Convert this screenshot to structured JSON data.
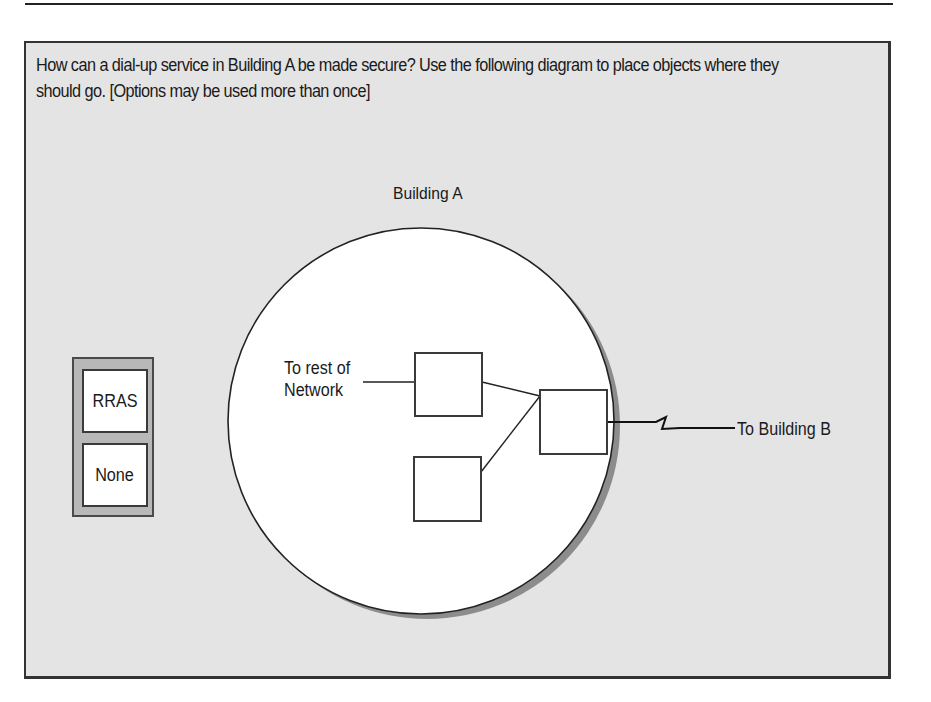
{
  "question": {
    "text": "How can a dial-up service in Building A be made secure?  Use the following diagram to place objects where they should go. [Options may be used more than once]"
  },
  "diagram": {
    "building_label": "Building A",
    "network_label_line1": "To rest of",
    "network_label_line2": "Network",
    "building_b_label": "To Building B",
    "drop_targets": [
      {
        "id": "target-upper-left",
        "value": ""
      },
      {
        "id": "target-right",
        "value": ""
      },
      {
        "id": "target-lower-left",
        "value": ""
      }
    ]
  },
  "palette": {
    "options": [
      {
        "label": "RRAS"
      },
      {
        "label": "None"
      }
    ]
  },
  "colors": {
    "frame_bg": "#e4e4e4",
    "circle_fill": "#ffffff",
    "circle_shadow": "#8c8c8c",
    "palette_bg": "#b8b8b8",
    "stroke": "#222222"
  }
}
